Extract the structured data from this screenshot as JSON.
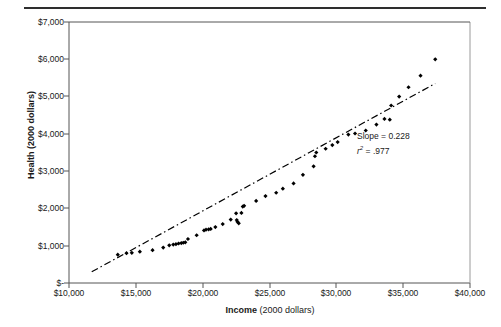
{
  "figure": {
    "top_caption": "FIGURE 1",
    "annotation": {
      "slope_label": "Slope = 0.228",
      "r_symbol": "r",
      "r_superscript": "2",
      "r_value": "= .977"
    }
  },
  "axes": {
    "y": {
      "title": "Health (2000 dollars)",
      "tick_labels": [
        "$7,000",
        "$6,000",
        "$5,000",
        "$4,000",
        "$3,000",
        "$2,000",
        "$1,000",
        "$-"
      ],
      "min": 0,
      "max": 7000
    },
    "x": {
      "title_bold": "Income",
      "title_rest": " (2000 dollars)",
      "tick_labels": [
        "$10,000",
        "$15,000",
        "$20,000",
        "$25,000",
        "$30,000",
        "$35,000",
        "$40,000"
      ],
      "min": 10000,
      "max": 40000
    }
  },
  "colors": {
    "marker": "#000000",
    "trendline": "#000000",
    "axis": "#555555",
    "rule": "#2e2e2e"
  },
  "chart_data": {
    "type": "scatter",
    "title": "FIGURE 1",
    "xlabel": "Income (2000 dollars)",
    "ylabel": "Health (2000 dollars)",
    "xlim": [
      10000,
      40000
    ],
    "ylim": [
      0,
      7000
    ],
    "xticks": [
      10000,
      15000,
      20000,
      25000,
      30000,
      35000,
      40000
    ],
    "yticks": [
      0,
      1000,
      2000,
      3000,
      4000,
      5000,
      6000,
      7000
    ],
    "grid": false,
    "legend": null,
    "annotations": [
      "Slope = 0.228",
      "r2 = .977"
    ],
    "fit": {
      "type": "linear",
      "slope": 0.228,
      "r_squared": 0.977,
      "line_x": [
        11700,
        37400
      ],
      "line_y": [
        300,
        5350
      ],
      "style": "dash-dot"
    },
    "series": [
      {
        "name": "Health vs Income",
        "marker": "diamond",
        "points": [
          [
            13650,
            760
          ],
          [
            14300,
            800
          ],
          [
            14700,
            810
          ],
          [
            15300,
            840
          ],
          [
            16250,
            880
          ],
          [
            17050,
            950
          ],
          [
            17500,
            1010
          ],
          [
            17800,
            1030
          ],
          [
            18000,
            1040
          ],
          [
            18200,
            1060
          ],
          [
            18400,
            1070
          ],
          [
            18550,
            1080
          ],
          [
            18700,
            1090
          ],
          [
            18900,
            1180
          ],
          [
            19550,
            1280
          ],
          [
            20100,
            1410
          ],
          [
            20250,
            1430
          ],
          [
            20450,
            1440
          ],
          [
            20600,
            1450
          ],
          [
            20950,
            1500
          ],
          [
            21500,
            1580
          ],
          [
            22100,
            1700
          ],
          [
            22500,
            1870
          ],
          [
            22550,
            1690
          ],
          [
            22600,
            1640
          ],
          [
            22700,
            1600
          ],
          [
            22900,
            1880
          ],
          [
            23000,
            2050
          ],
          [
            23100,
            2070
          ],
          [
            24000,
            2200
          ],
          [
            24700,
            2330
          ],
          [
            25500,
            2420
          ],
          [
            26000,
            2530
          ],
          [
            26800,
            2670
          ],
          [
            27500,
            2900
          ],
          [
            28300,
            3130
          ],
          [
            28400,
            3400
          ],
          [
            28500,
            3500
          ],
          [
            29200,
            3600
          ],
          [
            29700,
            3700
          ],
          [
            30100,
            3780
          ],
          [
            30900,
            3980
          ],
          [
            31400,
            4010
          ],
          [
            32200,
            4090
          ],
          [
            33000,
            4250
          ],
          [
            33600,
            4400
          ],
          [
            34000,
            4380
          ],
          [
            34100,
            4760
          ],
          [
            34700,
            5000
          ],
          [
            35400,
            5250
          ],
          [
            36300,
            5560
          ],
          [
            37400,
            6000
          ]
        ]
      }
    ]
  }
}
